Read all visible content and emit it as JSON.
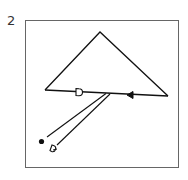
{
  "figure": {
    "number": "2",
    "colors": {
      "stroke": "#111111",
      "frame": "#666666",
      "background": "#ffffff"
    },
    "elements": {
      "triangle": {
        "apex": [
          100,
          32
        ],
        "left": [
          45,
          90
        ],
        "right": [
          168,
          96
        ]
      },
      "base_markers": [
        {
          "type": "open-d-marker",
          "position": [
            79,
            92
          ]
        },
        {
          "type": "filled-arrowhead",
          "position": [
            130,
            95
          ]
        }
      ],
      "double_line": {
        "from": [
          108,
          94
        ],
        "to": [
          48,
          138
        ]
      },
      "end_markers": [
        {
          "type": "filled-dot",
          "position": [
            41,
            141
          ]
        },
        {
          "type": "open-d-marker",
          "position": [
            53,
            148
          ]
        }
      ]
    }
  }
}
